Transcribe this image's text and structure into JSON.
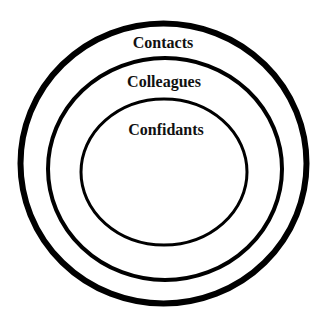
{
  "diagram": {
    "type": "concentric-circles",
    "background": "#ffffff",
    "stroke_color": "#000000",
    "rings": [
      {
        "label": "Contacts",
        "cx": 163.5,
        "cy": 163.5,
        "rx": 143,
        "ry": 140,
        "stroke_width": 6,
        "label_x": 163,
        "label_y": 48
      },
      {
        "label": "Colleagues",
        "cx": 165,
        "cy": 169,
        "rx": 117,
        "ry": 111,
        "stroke_width": 4,
        "label_x": 164,
        "label_y": 87
      },
      {
        "label": "Confidants",
        "cx": 164,
        "cy": 172,
        "rx": 83,
        "ry": 73,
        "stroke_width": 3,
        "label_x": 166,
        "label_y": 135
      }
    ]
  }
}
